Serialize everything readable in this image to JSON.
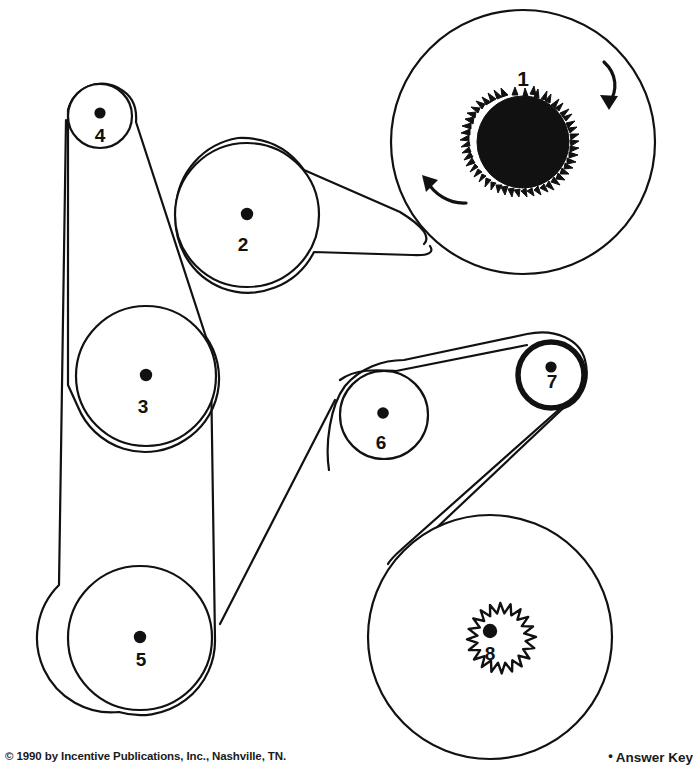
{
  "page": {
    "width": 699,
    "height": 774,
    "background_color": "#ffffff",
    "ink_color": "#111111"
  },
  "footer": {
    "copyright": "© 1990 by Incentive Publications, Inc., Nashville, TN.",
    "answer_key_bullet": "•",
    "answer_key_label": "Answer Key"
  },
  "diagram": {
    "kind": "pulley-belt-system",
    "pulley_count": 8,
    "pulleys": [
      {
        "id": 1,
        "label": "1",
        "cx": 523,
        "cy": 142,
        "r": 132,
        "outline": "thin",
        "hub_type": "fuzzy-disc",
        "hub_radius": 47,
        "label_x": 523,
        "label_y": 80,
        "notes": "largest pulley, spiky black hub, rotation arrows"
      },
      {
        "id": 2,
        "label": "2",
        "cx": 247,
        "cy": 215,
        "r": 72,
        "outline": "thin",
        "hub_type": "dot",
        "label_x": 243,
        "label_y": 246
      },
      {
        "id": 3,
        "label": "3",
        "cx": 146,
        "cy": 376,
        "r": 70,
        "outline": "thin",
        "hub_type": "dot",
        "label_x": 143,
        "label_y": 408
      },
      {
        "id": 4,
        "label": "4",
        "cx": 100,
        "cy": 116,
        "r": 32,
        "outline": "thin",
        "hub_type": "dot",
        "label_x": 100,
        "label_y": 137
      },
      {
        "id": 5,
        "label": "5",
        "cx": 140,
        "cy": 638,
        "r": 72,
        "outline": "thin",
        "hub_type": "dot",
        "label_x": 141,
        "label_y": 660
      },
      {
        "id": 6,
        "label": "6",
        "cx": 384,
        "cy": 415,
        "r": 44,
        "outline": "thin",
        "hub_type": "dot",
        "label_x": 381,
        "label_y": 443
      },
      {
        "id": 7,
        "label": "7",
        "cx": 551,
        "cy": 375,
        "r": 34,
        "outline": "thick",
        "hub_type": "dot",
        "label_x": 552,
        "label_y": 381,
        "notes": "bold/heavy rim"
      },
      {
        "id": 8,
        "label": "8",
        "cx": 490,
        "cy": 637,
        "r": 122,
        "outline": "thin",
        "hub_type": "gear",
        "hub_radius": 46,
        "gear_teeth": 20,
        "label_x": 490,
        "label_y": 656
      }
    ],
    "belts": [
      {
        "id": "belt-a",
        "name": "belt-4-3-5",
        "pulleys": [
          4,
          3,
          5
        ],
        "description": "left vertical belt linking pulleys 4, 3 and 5"
      },
      {
        "id": "belt-b",
        "name": "belt-2-1",
        "pulleys": [
          2,
          1
        ],
        "description": "belt from pulley 2 to large pulley 1"
      },
      {
        "id": "belt-c",
        "name": "belt-6-7-8",
        "pulleys": [
          6,
          7,
          8
        ],
        "description": "belt linking pulleys 6, 7 and 8"
      }
    ],
    "rotation_arrows": [
      {
        "id": "arrow-clockwise-upper-right",
        "pulley": 1,
        "direction": "clockwise",
        "position": "upper-right"
      },
      {
        "id": "arrow-clockwise-lower-left",
        "pulley": 1,
        "direction": "clockwise",
        "position": "lower-left"
      }
    ]
  }
}
